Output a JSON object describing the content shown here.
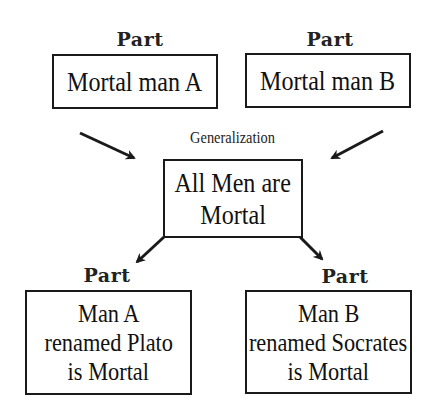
{
  "diagram": {
    "top_left": {
      "label": "Part",
      "text": "Mortal man A"
    },
    "top_right": {
      "label": "Part",
      "text": "Mortal man B"
    },
    "center": {
      "label": "Generalization",
      "lines": [
        "All Men are",
        "Mortal"
      ]
    },
    "bottom_left": {
      "label": "Part",
      "lines": [
        "Man A",
        "renamed Plato",
        "is Mortal"
      ]
    },
    "bottom_right": {
      "label": "Part",
      "lines": [
        "Man B",
        "renamed Socrates",
        "is Mortal"
      ]
    },
    "arrows": [
      {
        "from": "top_left",
        "to": "center"
      },
      {
        "from": "top_right",
        "to": "center"
      },
      {
        "from": "center",
        "to": "bottom_left"
      },
      {
        "from": "center",
        "to": "bottom_right"
      }
    ],
    "colors": {
      "stroke": "#1a1a1a",
      "background": "#ffffff"
    }
  }
}
